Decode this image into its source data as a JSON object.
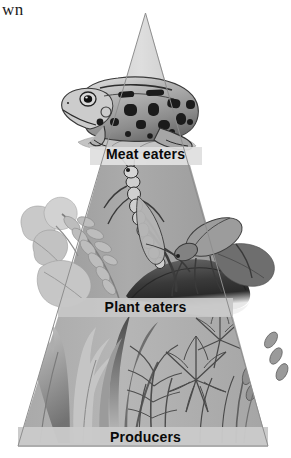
{
  "page": {
    "corner_text": "wn",
    "diagram_type": "energy pyramid",
    "background_color": "#ffffff"
  },
  "pyramid": {
    "apex_color": "#d9d9d9",
    "tier_mid_color": "#a8a8a8",
    "tier_base_color": "#b0b0b0",
    "band_color": "#c9c9c9",
    "outline_color": "#8a8a8a",
    "tiers": [
      {
        "id": "meat-eaters",
        "label": "Meat eaters",
        "level": 3,
        "organisms": [
          "frog"
        ],
        "fill": "#d9d9d9"
      },
      {
        "id": "plant-eaters",
        "label": "Plant eaters",
        "level": 2,
        "organisms": [
          "grasshopper",
          "leaves",
          "clover"
        ],
        "fill": "#a8a8a8"
      },
      {
        "id": "producers",
        "label": "Producers",
        "level": 1,
        "organisms": [
          "grass",
          "dandelion leaves",
          "wheat",
          "sedge"
        ],
        "fill": "#b0b0b0"
      }
    ]
  },
  "labels": {
    "meat_eaters": "Meat eaters",
    "plant_eaters": "Plant eaters",
    "producers": "Producers"
  }
}
